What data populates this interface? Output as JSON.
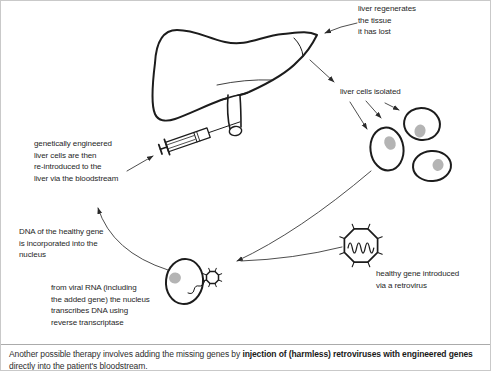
{
  "page": {
    "background": "#ffffff",
    "border_color": "#c9c9c9"
  },
  "colors": {
    "ink": "#1c1c1c",
    "arrow": "#3a3a3a",
    "nucleus_gray": "#b4b4b4",
    "rule_gray": "#ababab"
  },
  "figures": {
    "liver": "liver-illustration",
    "gallbladder_duct": "gallbladder-duct",
    "syringe": "syringe-icon",
    "isolated_cells": "isolated-liver-cells",
    "infected_cell": "liver-cell-with-retrovirus",
    "retrovirus": "retrovirus-icon",
    "isolated_cells_count": 3
  },
  "labels": {
    "liver_regenerates": "liver regenerates\nthe tissue\nit has lost",
    "liver_cells_isolated": "liver cells isolated",
    "engineered_cells": "genetically engineered\nliver cells are then\nre-introduced to the\nliver via the bloodstream",
    "dna_incorporated": "DNA of the healthy gene\nis incorporated into the\nnucleus",
    "viral_rna": "from viral RNA (including\nthe added gene) the nucleus\ntranscribes DNA using\nreverse transcriptase",
    "healthy_gene": "healthy gene introduced\nvia a retrovirus"
  },
  "caption": {
    "line1_regular": "Another possible therapy involves adding the missing genes by ",
    "line1_bold": "injection of (harmless) retroviruses with engineered genes",
    "line2": "directly into the patient's bloodstream."
  }
}
